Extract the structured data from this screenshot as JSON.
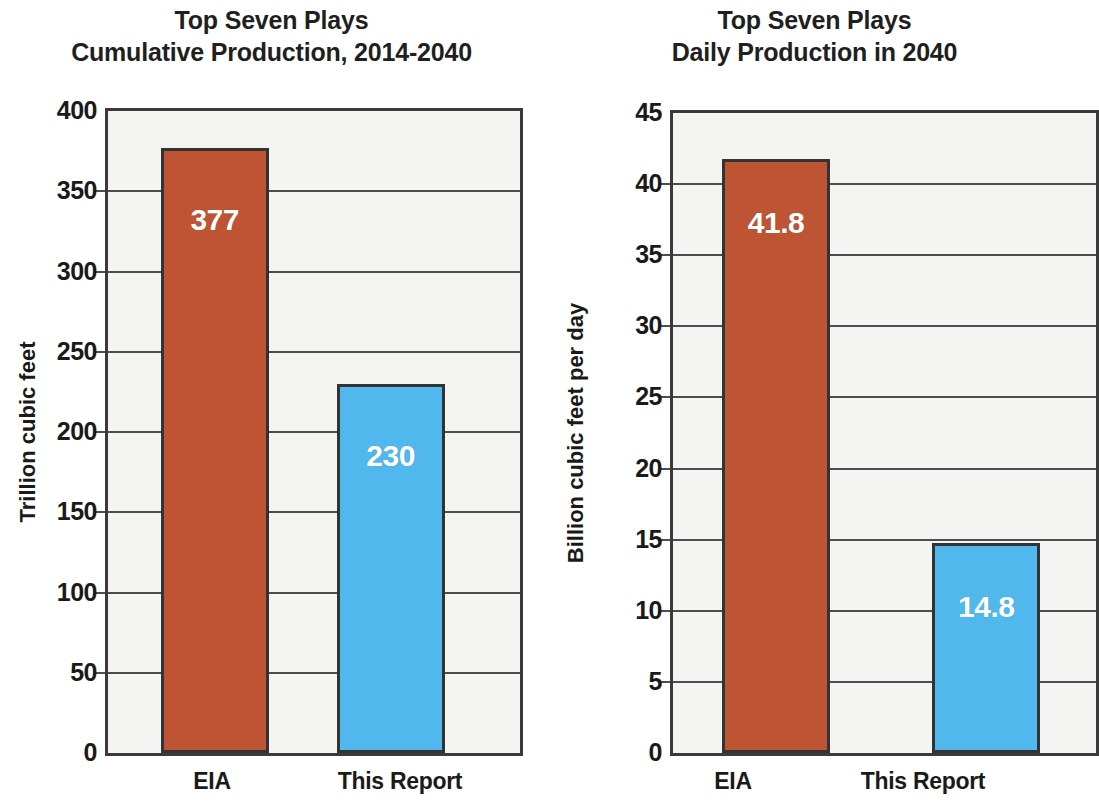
{
  "chart_data": [
    {
      "type": "bar",
      "panel": "left",
      "title_line1": "Top Seven Plays",
      "title_line2": "Cumulative Production, 2014-2040",
      "ylabel": "Trillion cubic feet",
      "xlabel": "",
      "categories": [
        "EIA",
        "This Report"
      ],
      "values": [
        377,
        230
      ],
      "value_labels": [
        "377",
        "230"
      ],
      "series": [
        {
          "name": "EIA",
          "value": 377,
          "color": "#be5434"
        },
        {
          "name": "This Report",
          "value": 230,
          "color": "#50b8ec"
        }
      ],
      "ylim": [
        0,
        400
      ],
      "ytick_step": 50,
      "yticks": [
        "0",
        "50",
        "100",
        "150",
        "200",
        "250",
        "300",
        "350",
        "400"
      ],
      "grid": true,
      "legend": "none"
    },
    {
      "type": "bar",
      "panel": "right",
      "title_line1": "Top Seven Plays",
      "title_line2": "Daily Production in 2040",
      "ylabel": "Billion cubic feet per day",
      "xlabel": "",
      "categories": [
        "EIA",
        "This Report"
      ],
      "values": [
        41.8,
        14.8
      ],
      "value_labels": [
        "41.8",
        "14.8"
      ],
      "series": [
        {
          "name": "EIA",
          "value": 41.8,
          "color": "#be5434"
        },
        {
          "name": "This Report",
          "value": 14.8,
          "color": "#50b8ec"
        }
      ],
      "ylim": [
        0,
        45
      ],
      "ytick_step": 5,
      "yticks": [
        "0",
        "5",
        "10",
        "15",
        "20",
        "25",
        "30",
        "35",
        "40",
        "45"
      ],
      "grid": true,
      "legend": "none"
    }
  ],
  "colors": {
    "bar_red": "#be5434",
    "bar_blue": "#50b8ec",
    "bar_outline": "#333333",
    "axis": "#3a3a3a",
    "grid": "#4d4d4d",
    "plot_bg": "#f4f4f2",
    "text": "#1a1a1a",
    "bar_label_text": "#ffffff"
  }
}
